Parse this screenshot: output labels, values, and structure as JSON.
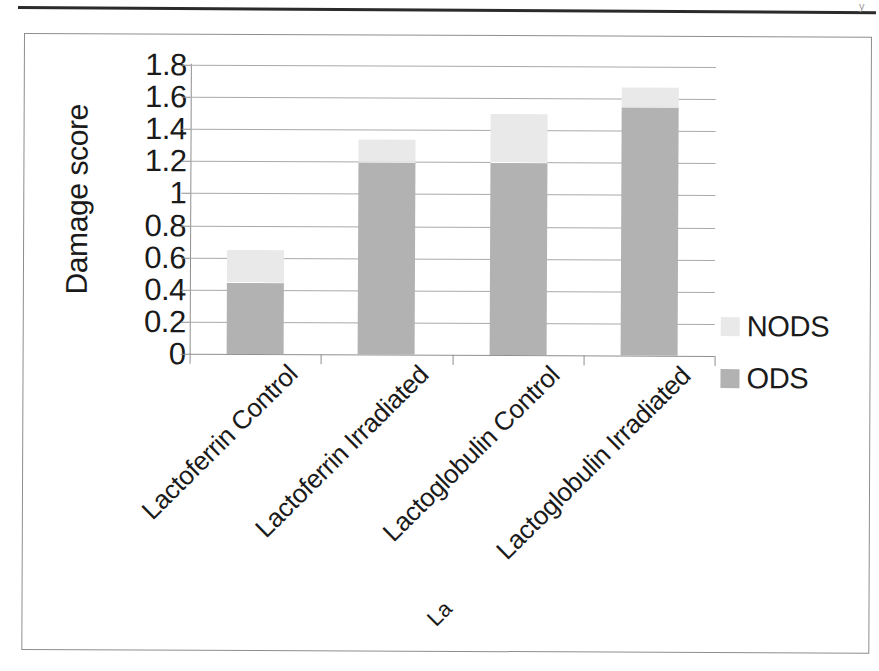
{
  "page": {
    "corner_mark": "y",
    "bottom_mark": "",
    "stray_label_fragment": "La"
  },
  "chart_data": {
    "type": "bar",
    "subtype": "stacked-bar",
    "title": "",
    "xlabel": "",
    "ylabel": "Damage score",
    "ylim": [
      0,
      1.8
    ],
    "ytick_labels": [
      "1.8",
      "1.6",
      "1.4",
      "1.2",
      "1",
      "0.8",
      "0.6",
      "0.4",
      "0.2",
      "0"
    ],
    "ytick_values": [
      1.8,
      1.6,
      1.4,
      1.2,
      1.0,
      0.8,
      0.6,
      0.4,
      0.2,
      0
    ],
    "grid": true,
    "legend_position": "right",
    "categories": [
      "Lactoferrin Control",
      "Lactoferrin Irradiated",
      "Lactoglobulin Control",
      "Lactoglobulin Irradiated"
    ],
    "series": [
      {
        "name": "ODS",
        "color": "#b2b2b2",
        "values": [
          0.45,
          1.2,
          1.2,
          1.55
        ]
      },
      {
        "name": "NODS",
        "color": "#e9e9e9",
        "values": [
          0.2,
          0.14,
          0.3,
          0.12
        ]
      }
    ],
    "stack_totals": [
      0.65,
      1.34,
      1.5,
      1.67
    ],
    "legend": [
      {
        "label": "NODS",
        "color": "#e9e9e9"
      },
      {
        "label": "ODS",
        "color": "#b2b2b2"
      }
    ]
  }
}
